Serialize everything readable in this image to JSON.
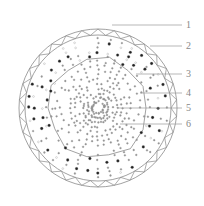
{
  "diagram": {
    "type": "cross-section",
    "colors": {
      "line": "#8a8a8a",
      "fill": "#ffffff",
      "dark_cell": "#222222"
    },
    "labels": [
      {
        "text": "1",
        "y": 25
      },
      {
        "text": "2",
        "y": 46
      },
      {
        "text": "3",
        "y": 74
      },
      {
        "text": "4",
        "y": 93
      },
      {
        "text": "5",
        "y": 108
      },
      {
        "text": "6",
        "y": 124
      }
    ]
  }
}
